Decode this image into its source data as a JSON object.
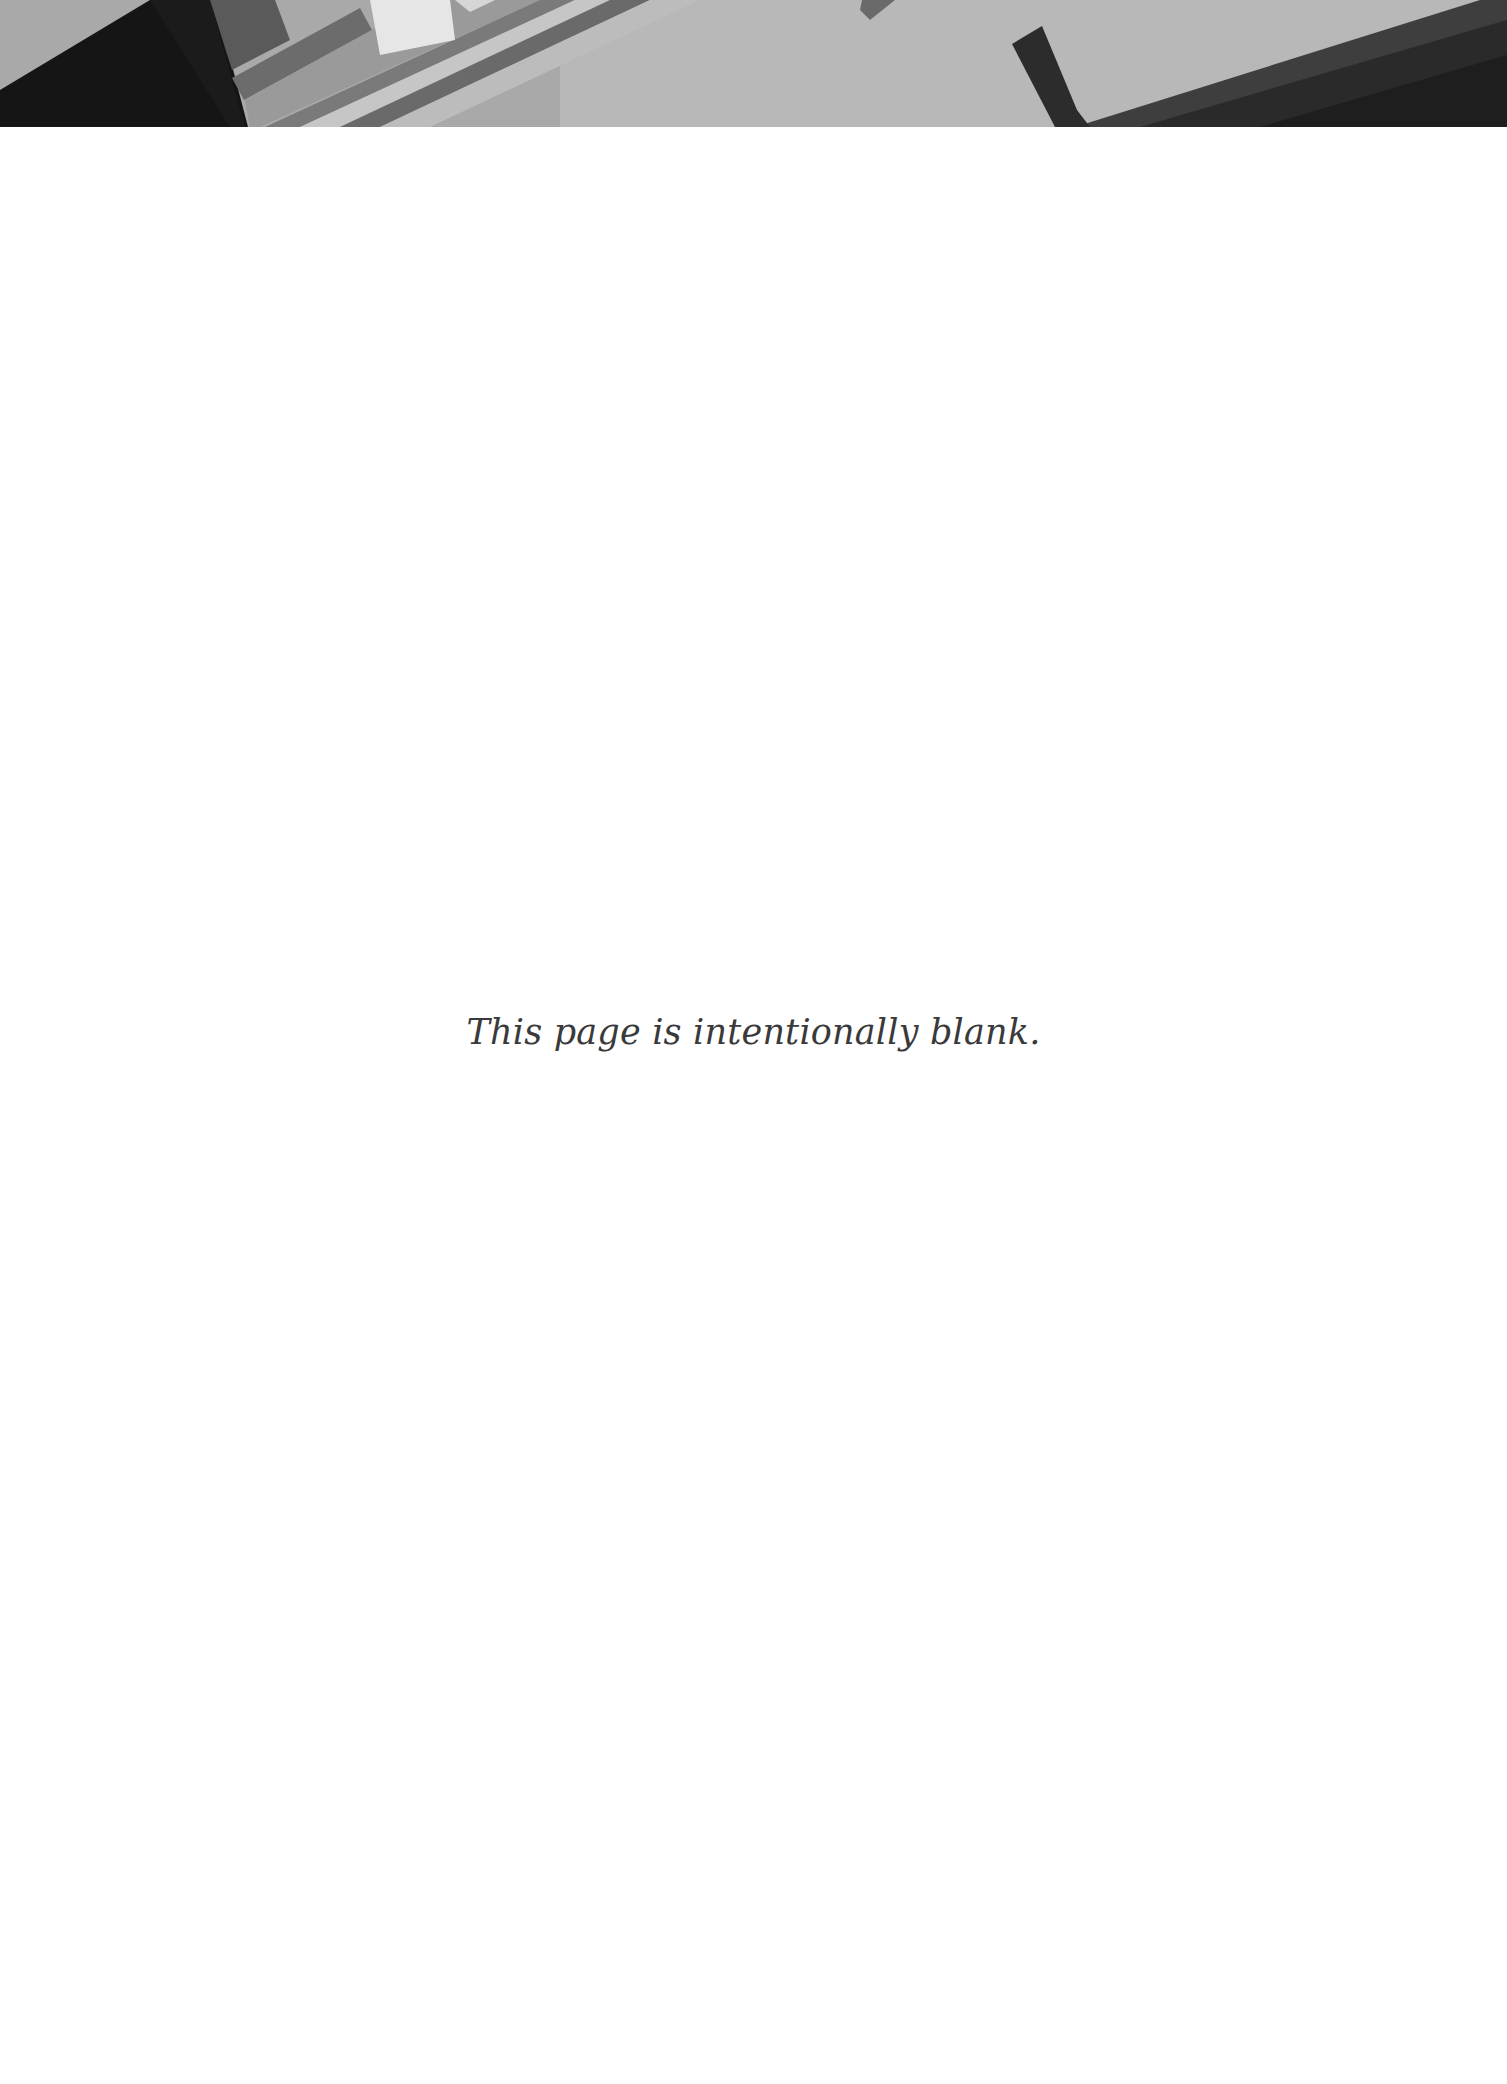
{
  "page": {
    "banner": {
      "description": "abstract grayscale geometric header band",
      "colors": {
        "base": "#a8a8a8",
        "light": "#c9c9c9",
        "highlight": "#e4e4e4",
        "mid": "#7a7a7a",
        "dark": "#3c3c3c",
        "darkest": "#141414"
      }
    },
    "body_text": "This page is intentionally blank."
  }
}
